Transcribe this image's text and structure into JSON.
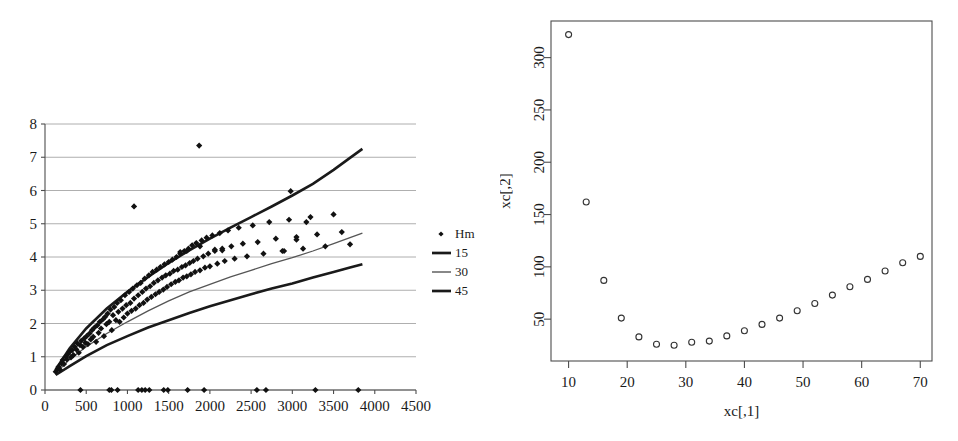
{
  "figure": {
    "panels": [
      "left-scatter-with-fit-curves",
      "right-scatter"
    ]
  },
  "chart_data": [
    {
      "id": "left",
      "type": "scatter",
      "title": "",
      "xlabel": "",
      "ylabel": "",
      "xlim": [
        0,
        4500
      ],
      "ylim": [
        0,
        8
      ],
      "xticks": [
        0,
        500,
        1000,
        1500,
        2000,
        2500,
        3000,
        3500,
        4000,
        4500
      ],
      "yticks": [
        0,
        1,
        2,
        3,
        4,
        5,
        6,
        7,
        8
      ],
      "grid": "horizontal",
      "legend_position": "right-outside",
      "legend": [
        {
          "label": "Hm",
          "marker": "diamond",
          "style": "marker"
        },
        {
          "label": "15",
          "marker": "line",
          "style": "thick-line"
        },
        {
          "label": "30",
          "marker": "line",
          "style": "thin-line"
        },
        {
          "label": "45",
          "marker": "line",
          "style": "thick-line"
        }
      ],
      "series": [
        {
          "name": "Hm",
          "marker": "diamond",
          "points": [
            [
              130,
              0.55
            ],
            [
              150,
              0.62
            ],
            [
              165,
              0.7
            ],
            [
              180,
              0.62
            ],
            [
              200,
              0.8
            ],
            [
              215,
              0.9
            ],
            [
              230,
              0.78
            ],
            [
              250,
              1.0
            ],
            [
              265,
              0.92
            ],
            [
              280,
              1.08
            ],
            [
              300,
              1.15
            ],
            [
              315,
              0.98
            ],
            [
              330,
              1.2
            ],
            [
              345,
              1.05
            ],
            [
              360,
              1.3
            ],
            [
              380,
              1.22
            ],
            [
              395,
              1.4
            ],
            [
              410,
              1.12
            ],
            [
              425,
              1.35
            ],
            [
              440,
              1.48
            ],
            [
              460,
              1.3
            ],
            [
              475,
              1.55
            ],
            [
              490,
              1.42
            ],
            [
              505,
              1.62
            ],
            [
              520,
              1.38
            ],
            [
              540,
              1.7
            ],
            [
              555,
              1.52
            ],
            [
              570,
              1.8
            ],
            [
              585,
              1.6
            ],
            [
              600,
              1.88
            ],
            [
              620,
              1.45
            ],
            [
              635,
              1.95
            ],
            [
              650,
              1.72
            ],
            [
              665,
              2.05
            ],
            [
              680,
              1.85
            ],
            [
              700,
              2.12
            ],
            [
              715,
              1.62
            ],
            [
              730,
              2.2
            ],
            [
              745,
              1.98
            ],
            [
              760,
              2.3
            ],
            [
              780,
              2.05
            ],
            [
              795,
              2.42
            ],
            [
              810,
              1.8
            ],
            [
              825,
              2.25
            ],
            [
              840,
              2.5
            ],
            [
              860,
              2.1
            ],
            [
              875,
              2.62
            ],
            [
              890,
              2.35
            ],
            [
              905,
              2.05
            ],
            [
              920,
              2.7
            ],
            [
              940,
              2.45
            ],
            [
              955,
              2.18
            ],
            [
              970,
              2.85
            ],
            [
              985,
              2.55
            ],
            [
              1000,
              2.3
            ],
            [
              1020,
              2.95
            ],
            [
              1035,
              2.62
            ],
            [
              1050,
              2.38
            ],
            [
              1065,
              3.05
            ],
            [
              1080,
              2.75
            ],
            [
              1100,
              2.45
            ],
            [
              1115,
              3.15
            ],
            [
              1130,
              2.85
            ],
            [
              1145,
              2.55
            ],
            [
              1160,
              3.22
            ],
            [
              1180,
              2.95
            ],
            [
              1195,
              2.62
            ],
            [
              1210,
              3.35
            ],
            [
              1225,
              3.05
            ],
            [
              1240,
              2.72
            ],
            [
              1260,
              3.45
            ],
            [
              1275,
              3.12
            ],
            [
              1290,
              2.8
            ],
            [
              1305,
              3.55
            ],
            [
              1320,
              3.22
            ],
            [
              1340,
              2.88
            ],
            [
              1355,
              3.62
            ],
            [
              1370,
              3.3
            ],
            [
              1385,
              2.95
            ],
            [
              1400,
              3.7
            ],
            [
              1420,
              3.38
            ],
            [
              1435,
              3.02
            ],
            [
              1450,
              3.78
            ],
            [
              1465,
              3.45
            ],
            [
              1480,
              3.1
            ],
            [
              1500,
              3.85
            ],
            [
              1515,
              3.5
            ],
            [
              1530,
              3.18
            ],
            [
              1545,
              3.92
            ],
            [
              1560,
              3.58
            ],
            [
              1580,
              3.25
            ],
            [
              1595,
              4.0
            ],
            [
              1610,
              3.62
            ],
            [
              1625,
              3.3
            ],
            [
              1640,
              4.1
            ],
            [
              1660,
              3.7
            ],
            [
              1675,
              3.38
            ],
            [
              1690,
              4.18
            ],
            [
              1705,
              3.75
            ],
            [
              1720,
              3.42
            ],
            [
              1740,
              4.25
            ],
            [
              1755,
              3.82
            ],
            [
              1770,
              3.48
            ],
            [
              1785,
              4.35
            ],
            [
              1800,
              3.88
            ],
            [
              1820,
              3.55
            ],
            [
              1835,
              4.42
            ],
            [
              1850,
              3.95
            ],
            [
              1870,
              7.35
            ],
            [
              1880,
              3.6
            ],
            [
              1900,
              4.5
            ],
            [
              1920,
              4.02
            ],
            [
              1940,
              3.68
            ],
            [
              1960,
              4.58
            ],
            [
              1980,
              4.1
            ],
            [
              2000,
              3.72
            ],
            [
              2030,
              4.65
            ],
            [
              2060,
              4.18
            ],
            [
              2090,
              3.8
            ],
            [
              2120,
              4.72
            ],
            [
              2150,
              4.25
            ],
            [
              2180,
              3.88
            ],
            [
              2220,
              4.8
            ],
            [
              2260,
              4.32
            ],
            [
              2300,
              3.95
            ],
            [
              2350,
              4.88
            ],
            [
              2400,
              4.4
            ],
            [
              2450,
              4.02
            ],
            [
              2520,
              4.95
            ],
            [
              2580,
              4.45
            ],
            [
              2650,
              4.1
            ],
            [
              2720,
              5.05
            ],
            [
              2800,
              4.55
            ],
            [
              2880,
              4.18
            ],
            [
              2960,
              5.12
            ],
            [
              3050,
              4.6
            ],
            [
              3130,
              4.25
            ],
            [
              3220,
              5.2
            ],
            [
              3300,
              4.68
            ],
            [
              3400,
              4.32
            ],
            [
              3500,
              5.28
            ],
            [
              3600,
              4.75
            ],
            [
              3700,
              4.38
            ],
            [
              1080,
              5.52
            ],
            [
              2980,
              5.98
            ],
            [
              3170,
              5.05
            ],
            [
              3050,
              4.52
            ],
            [
              2900,
              4.18
            ],
            [
              1720,
              4.18
            ],
            [
              1640,
              4.15
            ],
            [
              1880,
              4.32
            ],
            [
              2060,
              4.22
            ],
            [
              2150,
              4.2
            ],
            [
              430,
              0.0
            ],
            [
              780,
              0.0
            ],
            [
              805,
              0.0
            ],
            [
              880,
              0.0
            ],
            [
              1130,
              0.0
            ],
            [
              1175,
              0.0
            ],
            [
              1215,
              0.0
            ],
            [
              1265,
              0.0
            ],
            [
              1440,
              0.0
            ],
            [
              1490,
              0.0
            ],
            [
              1730,
              0.0
            ],
            [
              1930,
              0.0
            ],
            [
              2570,
              0.0
            ],
            [
              2680,
              0.0
            ],
            [
              3280,
              0.0
            ],
            [
              3800,
              0.0
            ]
          ]
        },
        {
          "name": "15",
          "type": "curve",
          "points": [
            [
              130,
              0.62
            ],
            [
              300,
              1.25
            ],
            [
              500,
              1.85
            ],
            [
              750,
              2.45
            ],
            [
              1000,
              2.95
            ],
            [
              1250,
              3.4
            ],
            [
              1500,
              3.82
            ],
            [
              1750,
              4.2
            ],
            [
              2000,
              4.55
            ],
            [
              2250,
              4.88
            ],
            [
              2500,
              5.2
            ],
            [
              2750,
              5.52
            ],
            [
              3000,
              5.85
            ],
            [
              3250,
              6.2
            ],
            [
              3500,
              6.62
            ],
            [
              3700,
              6.98
            ],
            [
              3850,
              7.25
            ]
          ]
        },
        {
          "name": "30",
          "type": "curve",
          "points": [
            [
              130,
              0.5
            ],
            [
              300,
              0.92
            ],
            [
              500,
              1.3
            ],
            [
              750,
              1.7
            ],
            [
              1000,
              2.05
            ],
            [
              1250,
              2.38
            ],
            [
              1500,
              2.68
            ],
            [
              1750,
              2.95
            ],
            [
              2000,
              3.18
            ],
            [
              2250,
              3.4
            ],
            [
              2500,
              3.6
            ],
            [
              2750,
              3.8
            ],
            [
              3000,
              3.98
            ],
            [
              3250,
              4.18
            ],
            [
              3500,
              4.4
            ],
            [
              3700,
              4.58
            ],
            [
              3850,
              4.72
            ]
          ]
        },
        {
          "name": "45",
          "type": "curve",
          "points": [
            [
              130,
              0.45
            ],
            [
              300,
              0.72
            ],
            [
              500,
              1.02
            ],
            [
              750,
              1.35
            ],
            [
              1000,
              1.62
            ],
            [
              1250,
              1.88
            ],
            [
              1500,
              2.1
            ],
            [
              1750,
              2.32
            ],
            [
              2000,
              2.52
            ],
            [
              2250,
              2.7
            ],
            [
              2500,
              2.88
            ],
            [
              2750,
              3.05
            ],
            [
              3000,
              3.2
            ],
            [
              3250,
              3.38
            ],
            [
              3500,
              3.55
            ],
            [
              3700,
              3.68
            ],
            [
              3850,
              3.78
            ]
          ]
        }
      ]
    },
    {
      "id": "right",
      "type": "scatter",
      "title": "",
      "xlabel": "xc[,1]",
      "ylabel": "xc[,2]",
      "xlim": [
        7,
        72
      ],
      "ylim": [
        10,
        335
      ],
      "xticks": [
        10,
        20,
        30,
        40,
        50,
        60,
        70
      ],
      "yticks": [
        50,
        100,
        150,
        200,
        250,
        300
      ],
      "grid": "none",
      "marker": "open-circle",
      "points": [
        [
          10,
          322
        ],
        [
          13,
          162
        ],
        [
          16,
          87
        ],
        [
          19,
          51
        ],
        [
          22,
          33
        ],
        [
          25,
          26
        ],
        [
          28,
          25
        ],
        [
          31,
          28
        ],
        [
          34,
          29
        ],
        [
          37,
          34
        ],
        [
          40,
          39
        ],
        [
          43,
          45
        ],
        [
          46,
          51
        ],
        [
          49,
          58
        ],
        [
          52,
          65
        ],
        [
          55,
          73
        ],
        [
          58,
          81
        ],
        [
          61,
          88
        ],
        [
          64,
          96
        ],
        [
          67,
          104
        ],
        [
          70,
          110
        ]
      ]
    }
  ]
}
